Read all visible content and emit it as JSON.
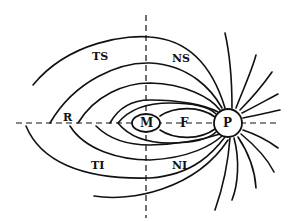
{
  "diagram": {
    "labels": {
      "ts": "TS",
      "ns": "NS",
      "r": "R",
      "m": "M",
      "f": "F",
      "p": "P",
      "ti": "TI",
      "ni": "NI"
    }
  }
}
